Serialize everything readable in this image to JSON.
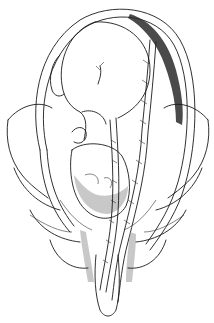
{
  "figure": {
    "description": "Line drawing illustration of a fetus inside the uterus within the maternal pelvis, with the umbilical cord descending through the cervix and vagina (cord prolapse)",
    "colors": {
      "background": "#ffffff",
      "ink": "#1a1a1a",
      "shading": "#9a9a9a"
    },
    "elements": [
      "uterus-outline",
      "fetus",
      "placenta",
      "umbilical-cord",
      "fetal-head",
      "pelvis",
      "vagina"
    ]
  }
}
